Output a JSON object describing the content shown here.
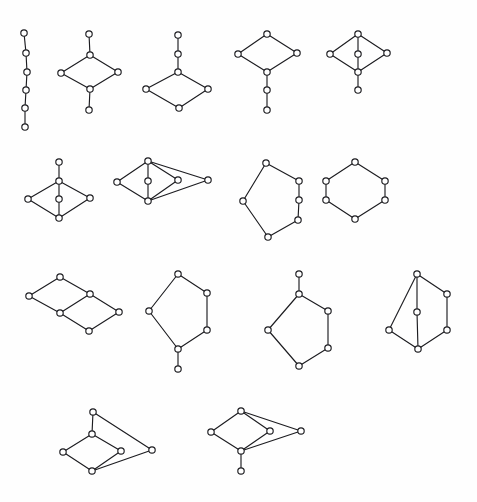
{
  "figure": {
    "title": "",
    "width": 477,
    "height": 502,
    "background_color": "#fefefe",
    "edge_color": "#1c1c20",
    "vertex_fill_color": "#ffffff",
    "vertex_radius": 3.2,
    "edge_stroke_width": 1.15
  },
  "graphs": [
    {
      "id": "graph-1",
      "name": "path-p6",
      "row": 1,
      "position": 1,
      "vertex_count": 6,
      "edge_count": 5,
      "vertices": [
        {
          "label": "a",
          "x": 24,
          "y": 33
        },
        {
          "label": "b",
          "x": 26,
          "y": 53
        },
        {
          "label": "c",
          "x": 27,
          "y": 72
        },
        {
          "label": "d",
          "x": 26,
          "y": 90
        },
        {
          "label": "e",
          "x": 25,
          "y": 108
        },
        {
          "label": "f",
          "x": 25,
          "y": 127
        }
      ],
      "edges": [
        [
          0,
          1
        ],
        [
          1,
          2
        ],
        [
          2,
          3
        ],
        [
          3,
          4
        ],
        [
          4,
          5
        ]
      ]
    },
    {
      "id": "graph-2",
      "name": "cycle4-two-pendants",
      "row": 1,
      "position": 2,
      "vertex_count": 6,
      "edge_count": 6,
      "vertices": [
        {
          "label": "a",
          "x": 89,
          "y": 34
        },
        {
          "label": "b",
          "x": 90,
          "y": 55
        },
        {
          "label": "c",
          "x": 61,
          "y": 73
        },
        {
          "label": "d",
          "x": 118,
          "y": 72
        },
        {
          "label": "e",
          "x": 90,
          "y": 89
        },
        {
          "label": "f",
          "x": 89,
          "y": 110
        }
      ],
      "edges": [
        [
          0,
          1
        ],
        [
          1,
          2
        ],
        [
          1,
          3
        ],
        [
          2,
          4
        ],
        [
          3,
          4
        ],
        [
          4,
          5
        ]
      ]
    },
    {
      "id": "graph-3",
      "name": "cycle4-path2-tail-top",
      "row": 1,
      "position": 3,
      "vertex_count": 6,
      "edge_count": 6,
      "vertices": [
        {
          "label": "a",
          "x": 178,
          "y": 35
        },
        {
          "label": "b",
          "x": 178,
          "y": 54
        },
        {
          "label": "c",
          "x": 178,
          "y": 72
        },
        {
          "label": "d",
          "x": 146,
          "y": 89
        },
        {
          "label": "e",
          "x": 208,
          "y": 89
        },
        {
          "label": "f",
          "x": 179,
          "y": 108
        }
      ],
      "edges": [
        [
          0,
          1
        ],
        [
          1,
          2
        ],
        [
          2,
          3
        ],
        [
          2,
          4
        ],
        [
          3,
          5
        ],
        [
          4,
          5
        ]
      ]
    },
    {
      "id": "graph-4",
      "name": "cycle4-path2-tail-bottom",
      "row": 1,
      "position": 4,
      "vertex_count": 6,
      "edge_count": 6,
      "vertices": [
        {
          "label": "a",
          "x": 267,
          "y": 34
        },
        {
          "label": "b",
          "x": 238,
          "y": 54
        },
        {
          "label": "c",
          "x": 297,
          "y": 53
        },
        {
          "label": "d",
          "x": 267,
          "y": 72
        },
        {
          "label": "e",
          "x": 267,
          "y": 90
        },
        {
          "label": "f",
          "x": 267,
          "y": 110
        }
      ],
      "edges": [
        [
          0,
          1
        ],
        [
          0,
          2
        ],
        [
          1,
          3
        ],
        [
          2,
          3
        ],
        [
          3,
          4
        ],
        [
          4,
          5
        ]
      ]
    },
    {
      "id": "graph-5",
      "name": "cycle4-center-vertex-pendant",
      "row": 1,
      "position": 5,
      "vertex_count": 6,
      "edge_count": 7,
      "vertices": [
        {
          "label": "a",
          "x": 358,
          "y": 34
        },
        {
          "label": "b",
          "x": 330,
          "y": 54
        },
        {
          "label": "c",
          "x": 358,
          "y": 54
        },
        {
          "label": "d",
          "x": 387,
          "y": 53
        },
        {
          "label": "e",
          "x": 358,
          "y": 72
        },
        {
          "label": "f",
          "x": 358,
          "y": 90
        }
      ],
      "edges": [
        [
          0,
          1
        ],
        [
          0,
          2
        ],
        [
          0,
          3
        ],
        [
          1,
          4
        ],
        [
          2,
          4
        ],
        [
          3,
          4
        ],
        [
          4,
          5
        ]
      ]
    },
    {
      "id": "graph-6",
      "name": "cycle4-center-vertex-pendant-top",
      "row": 2,
      "position": 1,
      "vertex_count": 6,
      "edge_count": 7,
      "vertices": [
        {
          "label": "a",
          "x": 59,
          "y": 162
        },
        {
          "label": "b",
          "x": 59,
          "y": 181
        },
        {
          "label": "c",
          "x": 28,
          "y": 199
        },
        {
          "label": "d",
          "x": 59,
          "y": 199
        },
        {
          "label": "e",
          "x": 90,
          "y": 198
        },
        {
          "label": "f",
          "x": 59,
          "y": 218
        }
      ],
      "edges": [
        [
          0,
          1
        ],
        [
          1,
          2
        ],
        [
          1,
          3
        ],
        [
          1,
          4
        ],
        [
          2,
          5
        ],
        [
          3,
          5
        ],
        [
          4,
          5
        ]
      ]
    },
    {
      "id": "graph-7",
      "name": "theta-graph-extended",
      "row": 2,
      "position": 2,
      "vertex_count": 6,
      "edge_count": 8,
      "vertices": [
        {
          "label": "a",
          "x": 148,
          "y": 161
        },
        {
          "label": "b",
          "x": 117,
          "y": 182
        },
        {
          "label": "c",
          "x": 148,
          "y": 181
        },
        {
          "label": "d",
          "x": 178,
          "y": 180
        },
        {
          "label": "e",
          "x": 208,
          "y": 180
        },
        {
          "label": "f",
          "x": 148,
          "y": 201
        }
      ],
      "edges": [
        [
          0,
          1
        ],
        [
          0,
          2
        ],
        [
          0,
          3
        ],
        [
          0,
          4
        ],
        [
          1,
          5
        ],
        [
          2,
          5
        ],
        [
          3,
          5
        ],
        [
          4,
          5
        ]
      ]
    },
    {
      "id": "graph-8",
      "name": "cycle6-irregular",
      "row": 2,
      "position": 3,
      "vertex_count": 6,
      "edge_count": 6,
      "vertices": [
        {
          "label": "a",
          "x": 266,
          "y": 163
        },
        {
          "label": "b",
          "x": 299,
          "y": 181
        },
        {
          "label": "c",
          "x": 299,
          "y": 200
        },
        {
          "label": "d",
          "x": 298,
          "y": 220
        },
        {
          "label": "e",
          "x": 268,
          "y": 237
        },
        {
          "label": "f",
          "x": 243,
          "y": 201
        }
      ],
      "edges": [
        [
          0,
          1
        ],
        [
          1,
          2
        ],
        [
          2,
          3
        ],
        [
          3,
          4
        ],
        [
          4,
          5
        ],
        [
          5,
          0
        ]
      ]
    },
    {
      "id": "graph-9",
      "name": "cycle6-hexagon",
      "row": 2,
      "position": 4,
      "vertex_count": 6,
      "edge_count": 6,
      "vertices": [
        {
          "label": "a",
          "x": 355,
          "y": 162
        },
        {
          "label": "b",
          "x": 385,
          "y": 181
        },
        {
          "label": "c",
          "x": 385,
          "y": 200
        },
        {
          "label": "d",
          "x": 355,
          "y": 219
        },
        {
          "label": "e",
          "x": 326,
          "y": 200
        },
        {
          "label": "f",
          "x": 326,
          "y": 181
        }
      ],
      "edges": [
        [
          0,
          1
        ],
        [
          1,
          2
        ],
        [
          2,
          3
        ],
        [
          3,
          4
        ],
        [
          4,
          5
        ],
        [
          5,
          0
        ]
      ]
    },
    {
      "id": "graph-10",
      "name": "ladder-two-squares",
      "row": 3,
      "position": 1,
      "vertex_count": 6,
      "edge_count": 7,
      "vertices": [
        {
          "label": "a",
          "x": 60,
          "y": 277
        },
        {
          "label": "b",
          "x": 29,
          "y": 296
        },
        {
          "label": "c",
          "x": 90,
          "y": 294
        },
        {
          "label": "d",
          "x": 60,
          "y": 313
        },
        {
          "label": "e",
          "x": 119,
          "y": 312
        },
        {
          "label": "f",
          "x": 89,
          "y": 331
        }
      ],
      "edges": [
        [
          0,
          1
        ],
        [
          0,
          2
        ],
        [
          1,
          3
        ],
        [
          2,
          3
        ],
        [
          2,
          4
        ],
        [
          3,
          5
        ],
        [
          4,
          5
        ]
      ]
    },
    {
      "id": "graph-11",
      "name": "cycle6-pendant-bottom",
      "row": 3,
      "position": 2,
      "vertex_count": 6,
      "edge_count": 6,
      "vertices": [
        {
          "label": "a",
          "x": 178,
          "y": 274
        },
        {
          "label": "b",
          "x": 207,
          "y": 293
        },
        {
          "label": "c",
          "x": 207,
          "y": 330
        },
        {
          "label": "d",
          "x": 178,
          "y": 349
        },
        {
          "label": "e",
          "x": 149,
          "y": 311
        },
        {
          "label": "f",
          "x": 178,
          "y": 369
        }
      ],
      "edges": [
        [
          0,
          1
        ],
        [
          1,
          2
        ],
        [
          2,
          3
        ],
        [
          3,
          4
        ],
        [
          4,
          0
        ],
        [
          3,
          5
        ]
      ]
    },
    {
      "id": "graph-12",
      "name": "cycle5-pendant-top",
      "row": 3,
      "position": 3,
      "vertex_count": 6,
      "edge_count": 6,
      "vertices": [
        {
          "label": "a",
          "x": 299,
          "y": 274
        },
        {
          "label": "b",
          "x": 299,
          "y": 294
        },
        {
          "label": "c",
          "x": 328,
          "y": 311
        },
        {
          "label": "d",
          "x": 328,
          "y": 348
        },
        {
          "label": "e",
          "x": 299,
          "y": 366
        },
        {
          "label": "f",
          "x": 268,
          "y": 330
        }
      ],
      "edges": [
        [
          0,
          1
        ],
        [
          1,
          2
        ],
        [
          2,
          3
        ],
        [
          3,
          4
        ],
        [
          4,
          5
        ],
        [
          5,
          1
        ]
      ]
    },
    {
      "id": "graph-13",
      "name": "theta-graph-vertical-chord",
      "row": 3,
      "position": 4,
      "vertex_count": 6,
      "edge_count": 7,
      "vertices": [
        {
          "label": "a",
          "x": 417,
          "y": 274
        },
        {
          "label": "b",
          "x": 447,
          "y": 294
        },
        {
          "label": "c",
          "x": 417,
          "y": 312
        },
        {
          "label": "d",
          "x": 447,
          "y": 330
        },
        {
          "label": "e",
          "x": 389,
          "y": 330
        },
        {
          "label": "f",
          "x": 418,
          "y": 349
        }
      ],
      "edges": [
        [
          0,
          1
        ],
        [
          1,
          3
        ],
        [
          3,
          5
        ],
        [
          5,
          4
        ],
        [
          4,
          0
        ],
        [
          0,
          2
        ],
        [
          2,
          5
        ]
      ]
    },
    {
      "id": "graph-14",
      "name": "diamond-pendant-top-apex-right",
      "row": 4,
      "position": 1,
      "vertex_count": 6,
      "edge_count": 7,
      "vertices": [
        {
          "label": "a",
          "x": 93,
          "y": 412
        },
        {
          "label": "b",
          "x": 92,
          "y": 434
        },
        {
          "label": "c",
          "x": 63,
          "y": 452
        },
        {
          "label": "d",
          "x": 121,
          "y": 451
        },
        {
          "label": "e",
          "x": 152,
          "y": 450
        },
        {
          "label": "f",
          "x": 92,
          "y": 471
        }
      ],
      "edges": [
        [
          0,
          1
        ],
        [
          0,
          4
        ],
        [
          1,
          2
        ],
        [
          1,
          3
        ],
        [
          2,
          5
        ],
        [
          3,
          5
        ],
        [
          4,
          5
        ]
      ]
    },
    {
      "id": "graph-15",
      "name": "diamond-apex-right-pendant-bottom",
      "row": 4,
      "position": 2,
      "vertex_count": 6,
      "edge_count": 7,
      "vertices": [
        {
          "label": "a",
          "x": 241,
          "y": 411
        },
        {
          "label": "b",
          "x": 211,
          "y": 432
        },
        {
          "label": "c",
          "x": 270,
          "y": 431
        },
        {
          "label": "d",
          "x": 301,
          "y": 431
        },
        {
          "label": "e",
          "x": 241,
          "y": 451
        },
        {
          "label": "f",
          "x": 241,
          "y": 471
        }
      ],
      "edges": [
        [
          0,
          1
        ],
        [
          0,
          2
        ],
        [
          0,
          3
        ],
        [
          1,
          4
        ],
        [
          2,
          4
        ],
        [
          3,
          4
        ],
        [
          4,
          5
        ]
      ]
    }
  ]
}
